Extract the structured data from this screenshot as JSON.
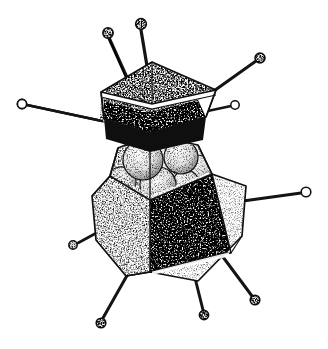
{
  "figure": {
    "title": "Adenovirus particle, cut-away stipple drawing",
    "subject": "adenovirus",
    "technique": "pen-and-ink stipple",
    "background_color": "#ffffff",
    "ink_color": "#111111",
    "caption": "",
    "labels": [],
    "width": 328,
    "height": 349
  },
  "parts": {
    "lid": {
      "name": "detached pentagonal capsid cap",
      "fill_light": "#f2f2f2",
      "fill_dark": "#1a1a1a",
      "rim_color": "#ffffff"
    },
    "body": {
      "name": "open icosahedral capsid shell",
      "fill_light": "#efefef",
      "fill_mid": "#cfcfcf",
      "fill_dark": "#161616"
    },
    "core": {
      "name": "internal genome core spheres",
      "count": 6,
      "fill": "#f4f4f4"
    },
    "fibers": {
      "name": "penton fibers with terminal knobs",
      "count": 9,
      "knob_fill": "#f6f6f6",
      "shaft_color": "#141414"
    }
  },
  "geometry": {
    "lid_outline": "152,62 216,90 208,118 150,134 100,122 101,92",
    "lid_top_light": "152,62 216,90 198,100 150,112 104,101 101,92",
    "lid_inner_dark": "150,112 198,100 206,117 150,133 104,119 104,101",
    "body_outline": "92,196 118,148 150,135 198,145 246,186 242,236 198,281 126,276 96,240",
    "body_cut_rim": "118,148 150,135 198,145 212,174 150,200 110,176",
    "body_face_dark": "150,200 212,174 230,254 150,272",
    "body_face_light_left": "110,176 150,200 150,272 126,276 96,240 92,196",
    "body_face_light_right": "212,174 246,186 242,236 198,281 150,272 230,254",
    "core_spheres": [
      {
        "cx": 143,
        "cy": 160,
        "r": 20
      },
      {
        "cx": 181,
        "cy": 157,
        "r": 17
      },
      {
        "cx": 197,
        "cy": 169,
        "r": 14
      },
      {
        "cx": 121,
        "cy": 182,
        "r": 15
      },
      {
        "cx": 158,
        "cy": 185,
        "r": 18
      },
      {
        "cx": 186,
        "cy": 183,
        "r": 13
      }
    ],
    "fiber_list": [
      {
        "id": "fiber-top-left",
        "x1": 128,
        "y1": 78,
        "x2": 108,
        "y2": 34,
        "knob_r": 5.2
      },
      {
        "id": "fiber-top-center",
        "x1": 146,
        "y1": 64,
        "x2": 141,
        "y2": 25,
        "knob_r": 5.4
      },
      {
        "id": "fiber-upper-right",
        "x1": 213,
        "y1": 92,
        "x2": 260,
        "y2": 58,
        "knob_r": 5.0
      },
      {
        "id": "fiber-right-upper",
        "x1": 205,
        "y1": 110,
        "x2": 235,
        "y2": 105,
        "knob_r": 4.2
      },
      {
        "id": "fiber-left",
        "x1": 100,
        "y1": 120,
        "x2": 22,
        "y2": 104,
        "knob_r": 4.6
      },
      {
        "id": "fiber-right",
        "x1": 244,
        "y1": 200,
        "x2": 306,
        "y2": 192,
        "knob_r": 4.8
      },
      {
        "id": "fiber-lower-left",
        "x1": 96,
        "y1": 232,
        "x2": 73,
        "y2": 245,
        "knob_r": 4.2
      },
      {
        "id": "fiber-bottom-left",
        "x1": 128,
        "y1": 272,
        "x2": 101,
        "y2": 323,
        "knob_r": 4.8
      },
      {
        "id": "fiber-bottom-center",
        "x1": 196,
        "y1": 278,
        "x2": 204,
        "y2": 315,
        "knob_r": 4.6
      },
      {
        "id": "fiber-bottom-right",
        "x1": 224,
        "y1": 258,
        "x2": 255,
        "y2": 300,
        "knob_r": 4.8
      }
    ]
  }
}
